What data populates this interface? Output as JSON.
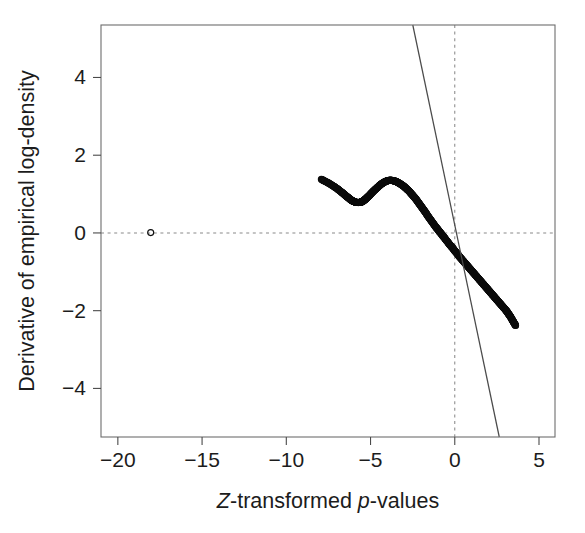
{
  "figure": {
    "background_color": "#ffffff",
    "foreground_color": "#1c1c1c",
    "frame_color": "#6d6d6d",
    "point_color": "#0c0c0c",
    "reference_line_color": "#4b4b4b",
    "guide_line_color": "#8a8a8a"
  },
  "chart_data": {
    "type": "scatter",
    "title": "",
    "subtitle": "",
    "xlabel": "Z-transformed p-values",
    "xlabel_parts": [
      {
        "text": "Z",
        "style": "italic"
      },
      {
        "text": "-transformed ",
        "style": "normal"
      },
      {
        "text": "p",
        "style": "italic"
      },
      {
        "text": "-values",
        "style": "normal"
      }
    ],
    "ylabel": "Derivative of empirical log-density",
    "ylabel_parts": [
      {
        "text": "Derivative of empirical log-density",
        "style": "normal"
      }
    ],
    "xlim": [
      -21.0,
      5.95
    ],
    "ylim": [
      -5.25,
      5.35
    ],
    "xticks": [
      -20,
      -15,
      -10,
      -5,
      0,
      5
    ],
    "xticklabels": [
      "−20",
      "−15",
      "−10",
      "−5",
      "0",
      "5"
    ],
    "yticks": [
      4,
      2,
      0,
      -2,
      -4
    ],
    "yticklabels": [
      "4",
      "2",
      "0",
      "−2",
      "−4"
    ],
    "grid": false,
    "legend": null,
    "legend_position": "none",
    "marker": "open-circle",
    "marker_size_px": 3.0,
    "annotations": [
      {
        "name": "horizontal-zero-guide",
        "kind": "hline",
        "y": 0,
        "style": "dashed"
      },
      {
        "name": "vertical-zero-guide",
        "kind": "vline",
        "x": 0,
        "style": "dashed"
      }
    ],
    "series": [
      {
        "name": "reference-line",
        "type": "line",
        "style": "solid",
        "description": "Straight theoretical null line of negative slope",
        "slope": -2.065,
        "intercept": 0.205,
        "x_endpoints": [
          -5.18,
          5.95
        ],
        "y_endpoints": [
          5.35,
          -12.08
        ],
        "visible_segment": {
          "x": [
            -5.18,
            5.95
          ],
          "y": [
            5.35,
            -5.25
          ]
        }
      },
      {
        "name": "outlier-points",
        "type": "scatter",
        "description": "Isolated open circle far in the left tail",
        "points": [
          [
            -18.05,
            0.01
          ]
        ]
      },
      {
        "name": "derivative-estimate",
        "type": "scatter",
        "description": "Dense sequence of open circles tracing the derivative of the empirical log-density",
        "x": [
          -7.92,
          -7.7,
          -7.48,
          -7.26,
          -7.08,
          -6.92,
          -6.78,
          -6.66,
          -6.55,
          -6.45,
          -6.36,
          -6.27,
          -6.19,
          -6.12,
          -6.05,
          -5.99,
          -5.93,
          -5.88,
          -5.83,
          -5.78,
          -5.73,
          -5.68,
          -5.63,
          -5.58,
          -5.53,
          -5.48,
          -5.42,
          -5.36,
          -5.3,
          -5.23,
          -5.16,
          -5.08,
          -5.0,
          -4.91,
          -4.82,
          -4.72,
          -4.62,
          -4.52,
          -4.42,
          -4.32,
          -4.22,
          -4.12,
          -4.02,
          -3.92,
          -3.82,
          -3.72,
          -3.62,
          -3.52,
          -3.42,
          -3.32,
          -3.22,
          -3.12,
          -3.02,
          -2.92,
          -2.82,
          -2.72,
          -2.62,
          -2.52,
          -2.42,
          -2.32,
          -2.22,
          -2.12,
          -2.02,
          -1.92,
          -1.82,
          -1.72,
          -1.62,
          -1.52,
          -1.42,
          -1.32,
          -1.22,
          -1.12,
          -1.02,
          -0.92,
          -0.82,
          -0.72,
          -0.62,
          -0.52,
          -0.42,
          -0.32,
          -0.22,
          -0.12,
          -0.02,
          0.08,
          0.18,
          0.28,
          0.38,
          0.48,
          0.58,
          0.68,
          0.78,
          0.88,
          0.98,
          1.08,
          1.18,
          1.28,
          1.38,
          1.48,
          1.58,
          1.68,
          1.78,
          1.88,
          1.98,
          2.08,
          2.18,
          2.28,
          2.38,
          2.48,
          2.58,
          2.68,
          2.78,
          2.88,
          2.98,
          3.06,
          3.14,
          3.22,
          3.3,
          3.38,
          3.46,
          3.54,
          3.61
        ],
        "y": [
          1.38,
          1.33,
          1.28,
          1.22,
          1.17,
          1.12,
          1.07,
          1.03,
          0.99,
          0.95,
          0.92,
          0.89,
          0.86,
          0.84,
          0.82,
          0.81,
          0.8,
          0.79,
          0.785,
          0.783,
          0.782,
          0.783,
          0.786,
          0.79,
          0.8,
          0.81,
          0.83,
          0.85,
          0.87,
          0.9,
          0.93,
          0.96,
          1.0,
          1.04,
          1.08,
          1.12,
          1.16,
          1.2,
          1.24,
          1.27,
          1.3,
          1.32,
          1.34,
          1.35,
          1.355,
          1.35,
          1.34,
          1.33,
          1.31,
          1.285,
          1.26,
          1.23,
          1.2,
          1.16,
          1.12,
          1.08,
          1.03,
          0.98,
          0.93,
          0.88,
          0.82,
          0.76,
          0.7,
          0.64,
          0.58,
          0.52,
          0.45,
          0.39,
          0.33,
          0.27,
          0.21,
          0.15,
          0.1,
          0.04,
          -0.01,
          -0.07,
          -0.12,
          -0.18,
          -0.23,
          -0.29,
          -0.34,
          -0.39,
          -0.45,
          -0.5,
          -0.55,
          -0.61,
          -0.66,
          -0.71,
          -0.76,
          -0.81,
          -0.86,
          -0.91,
          -0.96,
          -1.01,
          -1.06,
          -1.11,
          -1.16,
          -1.21,
          -1.26,
          -1.31,
          -1.36,
          -1.41,
          -1.46,
          -1.51,
          -1.56,
          -1.61,
          -1.66,
          -1.71,
          -1.76,
          -1.81,
          -1.86,
          -1.91,
          -1.96,
          -2.0,
          -2.05,
          -2.1,
          -2.15,
          -2.21,
          -2.27,
          -2.33,
          -2.38
        ]
      }
    ]
  }
}
